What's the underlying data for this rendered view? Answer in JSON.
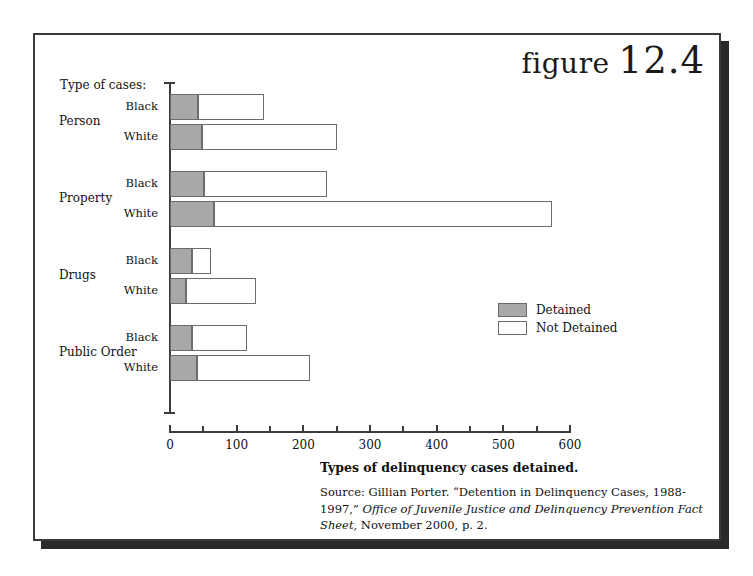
{
  "figure": {
    "word": "figure",
    "number": "12.4"
  },
  "axis_title": "Type of cases:",
  "legend": {
    "detained_label": "Detained",
    "not_detained_label": "Not Detained",
    "detained_color": "#a8a8a8",
    "not_detained_color": "#ffffff",
    "border_color": "#6c6c6c"
  },
  "caption": {
    "title": "Types of delinquency cases detained.",
    "source_prefix": "Source: Gillian Porter. “Detention in Delinquency Cases, 1988-1997,” ",
    "source_italic": "Office of Juvenile Justice and Delinquency Prevention Fact Sheet",
    "source_suffix": ", November 2000, p. 2."
  },
  "chart_data": {
    "type": "bar",
    "orientation": "horizontal",
    "stacked": true,
    "title": "Types of delinquency cases detained.",
    "xlabel": "",
    "ylabel": "Type of cases:",
    "xlim": [
      0,
      600
    ],
    "xticks": [
      0,
      100,
      200,
      300,
      400,
      500,
      600
    ],
    "xtick_labels": [
      "0",
      "100",
      "200",
      "300",
      "400",
      "500",
      "600"
    ],
    "minor_xticks": [
      50,
      150,
      250,
      350,
      450,
      550
    ],
    "grid": false,
    "legend_position": "center-right",
    "groups": [
      "Person",
      "Property",
      "Drugs",
      "Public Order"
    ],
    "subcategories": [
      "Black",
      "White"
    ],
    "series": [
      {
        "name": "Detained",
        "color": "#a8a8a8",
        "values": [
          42,
          48,
          51,
          66,
          33,
          24,
          33,
          41
        ]
      },
      {
        "name": "Not Detained",
        "color": "#ffffff",
        "values": [
          99,
          202,
          184,
          507,
          29,
          105,
          83,
          169
        ]
      }
    ],
    "bars": [
      {
        "group": "Person",
        "subcategory": "Black",
        "detained": 42,
        "not_detained": 99,
        "total": 141
      },
      {
        "group": "Person",
        "subcategory": "White",
        "detained": 48,
        "not_detained": 202,
        "total": 250
      },
      {
        "group": "Property",
        "subcategory": "Black",
        "detained": 51,
        "not_detained": 184,
        "total": 235
      },
      {
        "group": "Property",
        "subcategory": "White",
        "detained": 66,
        "not_detained": 507,
        "total": 573
      },
      {
        "group": "Drugs",
        "subcategory": "Black",
        "detained": 33,
        "not_detained": 29,
        "total": 62
      },
      {
        "group": "Drugs",
        "subcategory": "White",
        "detained": 24,
        "not_detained": 105,
        "total": 129
      },
      {
        "group": "Public Order",
        "subcategory": "Black",
        "detained": 33,
        "not_detained": 83,
        "total": 116
      },
      {
        "group": "Public Order",
        "subcategory": "White",
        "detained": 41,
        "not_detained": 169,
        "total": 210
      }
    ]
  }
}
